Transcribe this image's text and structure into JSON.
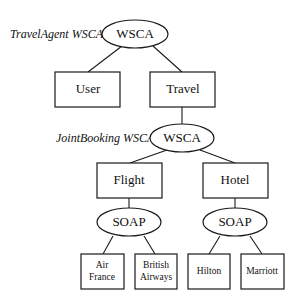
{
  "diagram": {
    "captions": {
      "top": "TravelAgent WSCA",
      "middle": "JointBooking WSCA"
    },
    "nodes": {
      "wsca_top": "WSCA",
      "user": "User",
      "travel": "Travel",
      "wsca_mid": "WSCA",
      "flight": "Flight",
      "hotel": "Hotel",
      "soap_flight": "SOAP",
      "soap_hotel": "SOAP",
      "air_france": [
        "Air",
        "France"
      ],
      "british_airways": [
        "British",
        "Airways"
      ],
      "hilton": "Hilton",
      "marriott": "Marriott"
    },
    "edges": [
      [
        "wsca_top",
        "user"
      ],
      [
        "wsca_top",
        "travel"
      ],
      [
        "travel",
        "wsca_mid"
      ],
      [
        "wsca_mid",
        "flight"
      ],
      [
        "wsca_mid",
        "hotel"
      ],
      [
        "flight",
        "soap_flight"
      ],
      [
        "hotel",
        "soap_hotel"
      ],
      [
        "soap_flight",
        "air_france"
      ],
      [
        "soap_flight",
        "british_airways"
      ],
      [
        "soap_hotel",
        "hilton"
      ],
      [
        "soap_hotel",
        "marriott"
      ]
    ]
  }
}
